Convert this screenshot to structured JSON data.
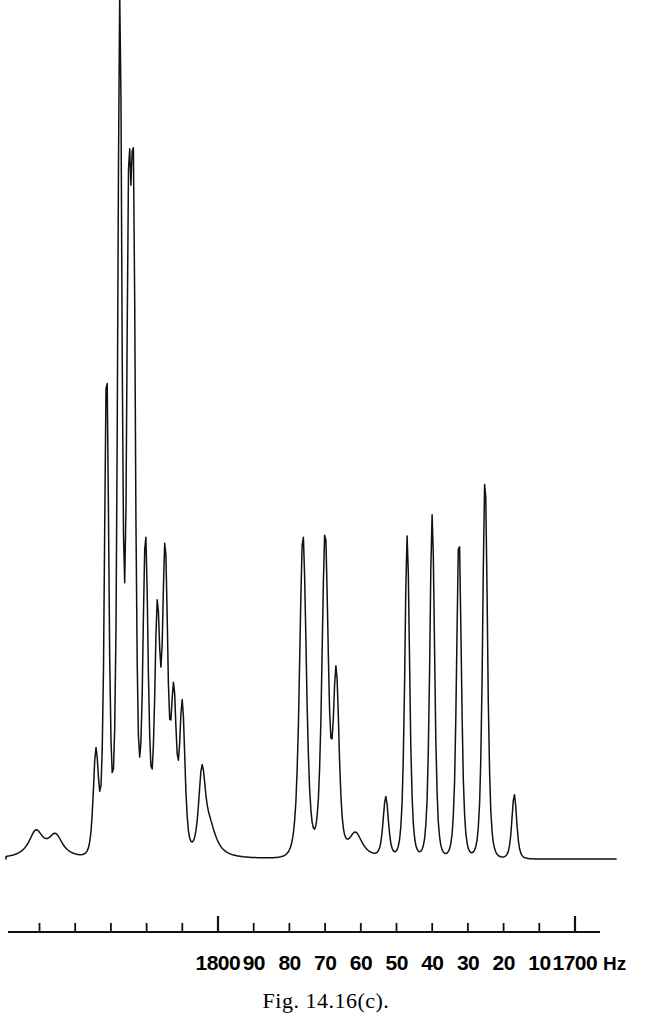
{
  "figure": {
    "caption": "Fig. 14.16(c).",
    "unit_label": "Hz",
    "background_color": "#ffffff",
    "trace_color": "#111111",
    "axis_color": "#111111"
  },
  "chart_data": {
    "type": "line",
    "title": "",
    "subtitle": "",
    "xlabel": "",
    "ylabel": "",
    "grid": false,
    "legend": null,
    "annotations": [],
    "xlim": [
      1857,
      1690
    ],
    "x_axis_direction": "decreasing-left-to-right",
    "axis_unit": "Hz",
    "tick_values": [
      1850,
      1840,
      1830,
      1820,
      1810,
      1800,
      1790,
      1780,
      1770,
      1760,
      1750,
      1740,
      1730,
      1720,
      1710,
      1700
    ],
    "tick_labels": [
      "",
      "",
      "",
      "",
      "",
      "1800",
      "90",
      "80",
      "70",
      "60",
      "50",
      "40",
      "30",
      "20",
      "10",
      "1700"
    ],
    "major_ticks": [
      1800,
      1700
    ],
    "ylim": [
      0,
      100
    ],
    "baseline_level": 1.5,
    "peaks": [
      {
        "x": 1834.2,
        "height": 12.0,
        "width": 1.1,
        "group": "left-cluster"
      },
      {
        "x": 1831.2,
        "height": 56.5,
        "width": 0.9,
        "group": "left-cluster"
      },
      {
        "x": 1827.5,
        "height": 98.5,
        "width": 0.9,
        "group": "left-cluster"
      },
      {
        "x": 1825.0,
        "height": 68.0,
        "width": 0.9,
        "group": "left-cluster"
      },
      {
        "x": 1823.7,
        "height": 70.5,
        "width": 0.9,
        "group": "left-cluster"
      },
      {
        "x": 1820.3,
        "height": 36.5,
        "width": 1.1,
        "group": "left-cluster"
      },
      {
        "x": 1817.0,
        "height": 27.0,
        "width": 1.1,
        "group": "left-cluster"
      },
      {
        "x": 1814.8,
        "height": 34.0,
        "width": 1.1,
        "group": "left-cluster"
      },
      {
        "x": 1812.4,
        "height": 17.5,
        "width": 1.1,
        "group": "left-cluster"
      },
      {
        "x": 1810.0,
        "height": 17.0,
        "width": 1.1,
        "group": "left-cluster"
      },
      {
        "x": 1804.5,
        "height": 8.5,
        "width": 1.3,
        "group": "left-cluster"
      },
      {
        "x": 1776.2,
        "height": 37.5,
        "width": 1.4,
        "group": "middle-cluster"
      },
      {
        "x": 1770.0,
        "height": 37.2,
        "width": 1.3,
        "group": "middle-cluster"
      },
      {
        "x": 1766.9,
        "height": 20.5,
        "width": 1.2,
        "group": "middle-cluster"
      },
      {
        "x": 1753.0,
        "height": 7.0,
        "width": 1.1,
        "group": "right-cluster"
      },
      {
        "x": 1747.0,
        "height": 37.5,
        "width": 1.0,
        "group": "right-cluster"
      },
      {
        "x": 1740.0,
        "height": 40.0,
        "width": 1.0,
        "group": "right-cluster"
      },
      {
        "x": 1732.5,
        "height": 37.5,
        "width": 1.0,
        "group": "right-cluster"
      },
      {
        "x": 1725.2,
        "height": 44.5,
        "width": 1.0,
        "group": "right-cluster"
      },
      {
        "x": 1717.0,
        "height": 7.5,
        "width": 1.0,
        "group": "right-cluster"
      }
    ],
    "baseline_bumps": [
      {
        "x": 1851.0,
        "height": 3.0
      },
      {
        "x": 1845.5,
        "height": 2.5
      },
      {
        "x": 1802.5,
        "height": 4.0
      },
      {
        "x": 1761.5,
        "height": 3.0
      }
    ]
  },
  "axis": {
    "labels": [
      {
        "text": "1800",
        "value": 1800
      },
      {
        "text": "90",
        "value": 1790
      },
      {
        "text": "80",
        "value": 1780
      },
      {
        "text": "70",
        "value": 1770
      },
      {
        "text": "60",
        "value": 1760
      },
      {
        "text": "50",
        "value": 1750
      },
      {
        "text": "40",
        "value": 1740
      },
      {
        "text": "30",
        "value": 1730
      },
      {
        "text": "20",
        "value": 1720
      },
      {
        "text": "10",
        "value": 1710
      },
      {
        "text": "1700",
        "value": 1700
      }
    ],
    "unit": "Hz"
  }
}
